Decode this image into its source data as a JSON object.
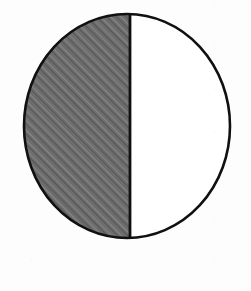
{
  "figure": {
    "kind": "fraction-circle-diagram",
    "title": "Circle divided into two equal parts with one half shaded",
    "background_color": "#fdfdfd",
    "outline_color": "#101010",
    "outline_width": 2.6,
    "divider_color": "#101010",
    "divider_width": 2.8,
    "shaded_fill_color": "#6e6e6e",
    "hatch_color": "#565656",
    "hatch_highlight_color": "#868686",
    "hatch_angle_degrees": 45,
    "unshaded_fill_color": "#ffffff",
    "center_x": 127,
    "center_y": 126,
    "radius_x": 103,
    "radius_y": 112,
    "divider_x": 130,
    "top_y": 14,
    "bottom_y": 238,
    "left_x": 24,
    "right_x": 230
  },
  "chart_data": {
    "type": "pie",
    "title": "Circle divided into two equal parts with one half shaded",
    "categories": [
      "shaded",
      "unshaded"
    ],
    "values": [
      1,
      1
    ],
    "fractions": [
      "1/2",
      "1/2"
    ],
    "percentages": [
      50,
      50
    ],
    "total_parts": 2,
    "shaded_parts": 1,
    "fraction_shaded": "1/2",
    "colors": [
      "#6e6e6e",
      "#ffffff"
    ],
    "fills": [
      "diagonal-hatch",
      "solid"
    ],
    "start_angle_degrees": 90,
    "direction": "counterclockwise",
    "legend": "none",
    "labels_shown": "none",
    "grid": false
  },
  "parts": {
    "left_half_name": "shaded-half",
    "right_half_name": "unshaded-half",
    "divider_name": "vertical-divider",
    "outline_name": "circle-outline"
  }
}
